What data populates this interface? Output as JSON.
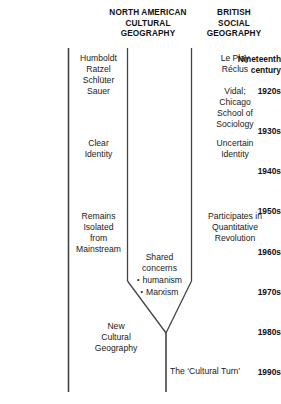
{
  "figure": {
    "type": "timeline-convergence-diagram",
    "headers": [
      {
        "id": "north-american",
        "label": "NORTH AMERICAN\nCULTURAL\nGEOGRAPHY"
      },
      {
        "id": "british-social",
        "label": "BRITISH\nSOCIAL\nGEOGRAPHY"
      }
    ],
    "periods": [
      {
        "id": "nineteenth-century",
        "label": "Nineteenth\ncentury"
      },
      {
        "id": "1920s",
        "label": "1920s"
      },
      {
        "id": "1930s",
        "label": "1930s"
      },
      {
        "id": "1940s",
        "label": "1940s"
      },
      {
        "id": "1950s",
        "label": "1950s"
      },
      {
        "id": "1960s",
        "label": "1960s"
      },
      {
        "id": "1970s",
        "label": "1970s"
      },
      {
        "id": "1980s",
        "label": "1980s"
      },
      {
        "id": "1990s",
        "label": "1990s"
      }
    ],
    "entries": {
      "na_nineteenth": "Humboldt\nRatzel\nSchlüter",
      "na_1920s": "Sauer",
      "na_1930s": "Clear\nIdentity",
      "na_1950s_1960s": "Remains\nIsolated\nfrom\nMainstream",
      "br_nineteenth": "Le Play\nRéclus",
      "br_1920s": "Vidal;\nChicago\nSchool of\nSociology",
      "br_1930s": "Uncertain\nIdentity",
      "br_1950s": "Participates in\nQuantitative\nRevolution",
      "shared_title": "Shared\nconcerns",
      "shared_items": [
        "humanism",
        "Marxism"
      ],
      "new_cultural_geography": "New\nCultural\nGeography",
      "cultural_turn": "The ‘Cultural Turn’"
    },
    "colors": {
      "background": "#ffffff",
      "text": "#1a1a1a",
      "heading": "#111111",
      "rule": "#444444"
    }
  }
}
